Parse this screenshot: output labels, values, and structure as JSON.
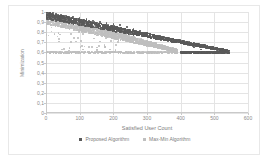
{
  "chart_data": {
    "type": "scatter",
    "title": "",
    "xlabel": "Satisfied User Count",
    "ylabel": "Minimization",
    "xlim": [
      0,
      600
    ],
    "ylim": [
      0,
      1
    ],
    "grid": true,
    "legend_position": "bottom",
    "xticks": [
      "0",
      "100",
      "200",
      "300",
      "400",
      "500",
      "600"
    ],
    "xtick_values": [
      0,
      100,
      200,
      300,
      400,
      500,
      600
    ],
    "yticks": [
      "0",
      "0,1",
      "0,2",
      "0,3",
      "0,4",
      "0,5",
      "0,6",
      "0,7",
      "0,8",
      "0,9",
      "1"
    ],
    "ytick_values": [
      0,
      0.1,
      0.2,
      0.3,
      0.4,
      0.5,
      0.6,
      0.7,
      0.8,
      0.9,
      1.0
    ],
    "series": [
      {
        "name": "Proposed Algorithm",
        "color": "#595959",
        "marker": "square",
        "description": "Dense upper band decaying from ~1.0 at x=0 to ~0.60 near x=480, then a flat saturated band at 0.60 extending to x~545.",
        "band": {
          "x_start": 0,
          "x_end": 545,
          "y_top_start": 1.0,
          "y_top_end": 0.62,
          "y_bot_start": 0.93,
          "y_bot_end": 0.6,
          "floor": 0.6,
          "floor_x_start": 400
        },
        "sample_points": [
          [
            5,
            1.0
          ],
          [
            12,
            0.99
          ],
          [
            20,
            0.99
          ],
          [
            30,
            0.98
          ],
          [
            45,
            0.97
          ],
          [
            60,
            0.96
          ],
          [
            80,
            0.95
          ],
          [
            100,
            0.94
          ],
          [
            120,
            0.93
          ],
          [
            140,
            0.91
          ],
          [
            160,
            0.9
          ],
          [
            180,
            0.89
          ],
          [
            200,
            0.88
          ],
          [
            220,
            0.87
          ],
          [
            240,
            0.85
          ],
          [
            260,
            0.83
          ],
          [
            280,
            0.81
          ],
          [
            300,
            0.79
          ],
          [
            320,
            0.77
          ],
          [
            340,
            0.75
          ],
          [
            360,
            0.73
          ],
          [
            380,
            0.71
          ],
          [
            400,
            0.69
          ],
          [
            420,
            0.67
          ],
          [
            440,
            0.65
          ],
          [
            460,
            0.63
          ],
          [
            480,
            0.61
          ],
          [
            500,
            0.6
          ],
          [
            520,
            0.6
          ],
          [
            540,
            0.6
          ]
        ]
      },
      {
        "name": "Max-Min Algorithm",
        "color": "#bfbfbf",
        "marker": "square",
        "description": "Lighter band decaying faster from ~1.0 at x=0 to ~0.60 near x=380, scattered low outliers down to 0.6 early on.",
        "band": {
          "x_start": 0,
          "x_end": 390,
          "y_top_start": 1.0,
          "y_top_end": 0.63,
          "y_bot_start": 0.88,
          "y_bot_end": 0.6,
          "floor": 0.6,
          "floor_x_start": 0
        },
        "sample_points": [
          [
            5,
            1.0
          ],
          [
            15,
            0.98
          ],
          [
            25,
            0.97
          ],
          [
            40,
            0.95
          ],
          [
            55,
            0.93
          ],
          [
            70,
            0.92
          ],
          [
            90,
            0.9
          ],
          [
            110,
            0.88
          ],
          [
            130,
            0.86
          ],
          [
            150,
            0.84
          ],
          [
            170,
            0.82
          ],
          [
            190,
            0.8
          ],
          [
            210,
            0.78
          ],
          [
            230,
            0.76
          ],
          [
            250,
            0.74
          ],
          [
            270,
            0.72
          ],
          [
            290,
            0.7
          ],
          [
            310,
            0.68
          ],
          [
            330,
            0.66
          ],
          [
            350,
            0.64
          ],
          [
            370,
            0.62
          ],
          [
            385,
            0.6
          ]
        ]
      }
    ],
    "annotations": [
      {
        "text": "Saturated floor band at y = 0,6 spanning the full satisfied-user range for both series",
        "y": 0.6
      }
    ]
  },
  "axes": {
    "x_title": "Satisfied User Count",
    "y_title": "Minimization"
  },
  "legend": {
    "entries": [
      {
        "label": "Proposed Algorithm",
        "color": "#595959"
      },
      {
        "label": "Max-Min Algorithm",
        "color": "#bfbfbf"
      }
    ]
  }
}
